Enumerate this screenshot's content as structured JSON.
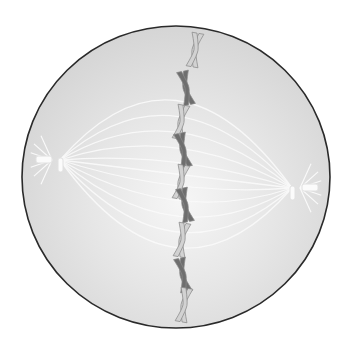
{
  "diagram": {
    "cell": {
      "cx": 176,
      "cy": 177,
      "rx": 154,
      "ry": 151,
      "fill": "#dcdcdc",
      "center_fill": "#f4f4f4",
      "stroke": "#2a2a2a"
    },
    "spindle_color": "#fafafa",
    "centrioles": [
      {
        "side": "left",
        "x": 52,
        "y": 160
      },
      {
        "side": "right",
        "x": 300,
        "y": 188
      }
    ],
    "chromosomes": [
      {
        "x": 195,
        "y": 50,
        "shade": "light"
      },
      {
        "x": 186,
        "y": 88,
        "shade": "dark"
      },
      {
        "x": 181,
        "y": 122,
        "shade": "light"
      },
      {
        "x": 183,
        "y": 150,
        "shade": "dark"
      },
      {
        "x": 181,
        "y": 182,
        "shade": "light"
      },
      {
        "x": 185,
        "y": 205,
        "shade": "dark"
      },
      {
        "x": 182,
        "y": 240,
        "shade": "light"
      },
      {
        "x": 183,
        "y": 275,
        "shade": "dark"
      },
      {
        "x": 184,
        "y": 305,
        "shade": "light"
      }
    ],
    "colors": {
      "dark": "#6e6e6e",
      "light": "#d2d2d2",
      "outline": "#8a8a8a"
    }
  }
}
